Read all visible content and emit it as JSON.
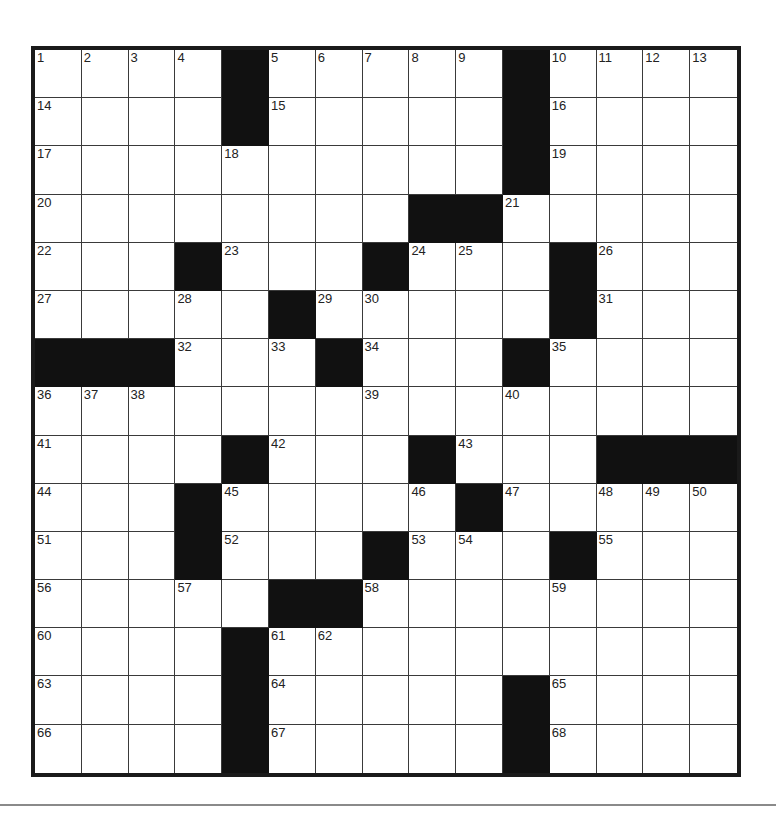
{
  "puzzle": {
    "rows": 15,
    "cols": 15,
    "layout": [
      "....#.....#....",
      "....#.....#....",
      "..........#....",
      "........##.....",
      "...#...#...#...",
      ".....#.....#...",
      "###...#...#....",
      "...............",
      "....#...#...###",
      "...#.....#.....",
      "...#...#...#...",
      ".....##........",
      "....#..........",
      "....#.....#....",
      "....#.....#...."
    ],
    "numbers": {
      "0,0": "1",
      "0,1": "2",
      "0,2": "3",
      "0,3": "4",
      "0,5": "5",
      "0,6": "6",
      "0,7": "7",
      "0,8": "8",
      "0,9": "9",
      "0,11": "10",
      "0,12": "11",
      "0,13": "12",
      "0,14": "13",
      "1,0": "14",
      "1,5": "15",
      "1,11": "16",
      "2,0": "17",
      "2,4": "18",
      "2,11": "19",
      "3,0": "20",
      "3,10": "21",
      "4,0": "22",
      "4,4": "23",
      "4,8": "24",
      "4,9": "25",
      "4,12": "26",
      "5,0": "27",
      "5,3": "28",
      "5,6": "29",
      "5,7": "30",
      "5,12": "31",
      "6,3": "32",
      "6,5": "33",
      "6,7": "34",
      "6,11": "35",
      "7,0": "36",
      "7,1": "37",
      "7,2": "38",
      "7,7": "39",
      "7,10": "40",
      "8,0": "41",
      "8,5": "42",
      "8,9": "43",
      "9,0": "44",
      "9,4": "45",
      "9,8": "46",
      "9,10": "47",
      "9,12": "48",
      "9,13": "49",
      "9,14": "50",
      "10,0": "51",
      "10,4": "52",
      "10,8": "53",
      "10,9": "54",
      "10,12": "55",
      "11,0": "56",
      "11,3": "57",
      "11,7": "58",
      "11,11": "59",
      "12,0": "60",
      "12,5": "61",
      "12,6": "62",
      "13,0": "63",
      "13,5": "64",
      "13,11": "65",
      "14,0": "66",
      "14,5": "67",
      "14,11": "68"
    },
    "colors": {
      "block": "#111111",
      "border": "#1a1a1a",
      "number": "#222222",
      "rule": "#8a8a8a"
    }
  }
}
